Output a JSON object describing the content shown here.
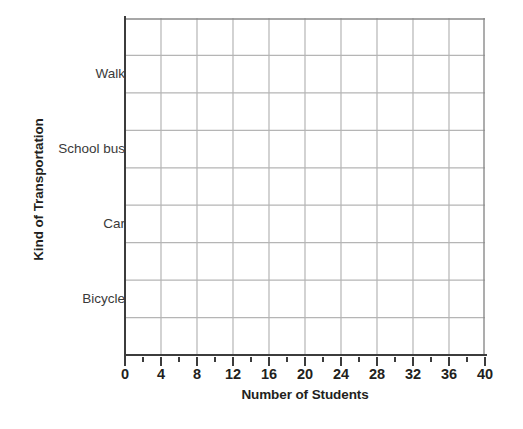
{
  "chart_data": {
    "type": "bar",
    "orientation": "horizontal",
    "title": "",
    "xlabel": "Number of Students",
    "ylabel": "Kind of Transportation",
    "categories": [
      "Walk",
      "School bus",
      "Car",
      "Bicycle"
    ],
    "values": [
      null,
      null,
      null,
      null
    ],
    "series": [
      {
        "name": "Number of Students",
        "values": [
          null,
          null,
          null,
          null
        ]
      }
    ],
    "xlim": [
      0,
      40
    ],
    "x_tick_labels": [
      "0",
      "4",
      "8",
      "12",
      "16",
      "20",
      "24",
      "28",
      "32",
      "36",
      "40"
    ],
    "x_tick_values": [
      0,
      4,
      8,
      12,
      16,
      20,
      24,
      28,
      32,
      36,
      40
    ],
    "x_minor_tick_values": [
      2,
      6,
      10,
      14,
      18,
      22,
      26,
      30,
      34,
      38
    ],
    "x_major_step": 4,
    "grid": true,
    "grid_columns": 10,
    "grid_rows": 9,
    "legend": "none",
    "note": "Blank worksheet grid: axes and labels drawn, no bars plotted",
    "colors": {
      "grid_line": "#b5b5b5",
      "axis_line": "#3c3c3c",
      "text": "#231f20",
      "category_text": "#3a3a3a",
      "background": "#ffffff"
    }
  },
  "axes": {
    "y_title": "Kind of Transportation",
    "x_title": "Number of Students",
    "y_categories": [
      {
        "label": "Walk",
        "row_index": 1
      },
      {
        "label": "School bus",
        "row_index": 3
      },
      {
        "label": "Car",
        "row_index": 5
      },
      {
        "label": "Bicycle",
        "row_index": 7
      }
    ],
    "x_ticks": [
      {
        "label": "0",
        "value": 0
      },
      {
        "label": "4",
        "value": 4
      },
      {
        "label": "8",
        "value": 8
      },
      {
        "label": "12",
        "value": 12
      },
      {
        "label": "16",
        "value": 16
      },
      {
        "label": "20",
        "value": 20
      },
      {
        "label": "24",
        "value": 24
      },
      {
        "label": "28",
        "value": 28
      },
      {
        "label": "32",
        "value": 32
      },
      {
        "label": "36",
        "value": 36
      },
      {
        "label": "40",
        "value": 40
      }
    ]
  }
}
